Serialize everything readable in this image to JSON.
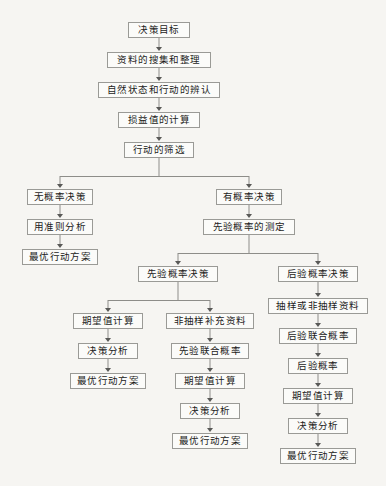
{
  "diagram": {
    "type": "flowchart",
    "orientation": "top-down",
    "style": {
      "background_color": "#f6f5f2",
      "node_fill": "#fbfbf9",
      "node_border": "#9a9a96",
      "connector_color": "#8d8d89",
      "text_color": "#1b1b1b"
    },
    "nodes": [
      {
        "id": "n1",
        "label": "决策目标",
        "cx": 159,
        "y": 22,
        "w": 62
      },
      {
        "id": "n2",
        "label": "资料的搜集和整理",
        "cx": 159,
        "y": 52,
        "w": 104
      },
      {
        "id": "n3",
        "label": "自然状态和行动的辨认",
        "cx": 159,
        "y": 82,
        "w": 122
      },
      {
        "id": "n4",
        "label": "损益值的计算",
        "cx": 159,
        "y": 112,
        "w": 82
      },
      {
        "id": "n5",
        "label": "行动的筛选",
        "cx": 159,
        "y": 142,
        "w": 70
      },
      {
        "id": "n6",
        "label": "无概率决策",
        "cx": 60,
        "y": 189,
        "w": 66
      },
      {
        "id": "n7",
        "label": "用准则分析",
        "cx": 60,
        "y": 219,
        "w": 66
      },
      {
        "id": "n8",
        "label": "最优行动方案",
        "cx": 60,
        "y": 249,
        "w": 76
      },
      {
        "id": "n9",
        "label": "有概率决策",
        "cx": 249,
        "y": 189,
        "w": 66
      },
      {
        "id": "n10",
        "label": "先验概率的测定",
        "cx": 249,
        "y": 219,
        "w": 92
      },
      {
        "id": "n11",
        "label": "先验概率决策",
        "cx": 178,
        "y": 266,
        "w": 80
      },
      {
        "id": "n12",
        "label": "后验概率决策",
        "cx": 318,
        "y": 266,
        "w": 80
      },
      {
        "id": "n13",
        "label": "期望值计算",
        "cx": 108,
        "y": 313,
        "w": 70
      },
      {
        "id": "n14",
        "label": "决策分析",
        "cx": 108,
        "y": 343,
        "w": 60
      },
      {
        "id": "n15",
        "label": "最优行动方案",
        "cx": 108,
        "y": 373,
        "w": 76
      },
      {
        "id": "n16",
        "label": "非抽样补充资料",
        "cx": 210,
        "y": 313,
        "w": 88
      },
      {
        "id": "n17",
        "label": "先验联合概率",
        "cx": 210,
        "y": 343,
        "w": 78
      },
      {
        "id": "n18",
        "label": "期望值计算",
        "cx": 210,
        "y": 373,
        "w": 70
      },
      {
        "id": "n19",
        "label": "决策分析",
        "cx": 210,
        "y": 403,
        "w": 60
      },
      {
        "id": "n20",
        "label": "最优行动方案",
        "cx": 210,
        "y": 433,
        "w": 76
      },
      {
        "id": "n21",
        "label": "抽样或非抽样资料",
        "cx": 318,
        "y": 298,
        "w": 100
      },
      {
        "id": "n22",
        "label": "后验联合概率",
        "cx": 318,
        "y": 328,
        "w": 78
      },
      {
        "id": "n23",
        "label": "后验概率",
        "cx": 318,
        "y": 358,
        "w": 60
      },
      {
        "id": "n24",
        "label": "期望值计算",
        "cx": 318,
        "y": 388,
        "w": 70
      },
      {
        "id": "n25",
        "label": "决策分析",
        "cx": 318,
        "y": 418,
        "w": 60
      },
      {
        "id": "n26",
        "label": "最优行动方案",
        "cx": 318,
        "y": 448,
        "w": 76
      }
    ],
    "edges": [
      {
        "from": "n1",
        "to": "n2",
        "kind": "straight"
      },
      {
        "from": "n2",
        "to": "n3",
        "kind": "straight"
      },
      {
        "from": "n3",
        "to": "n4",
        "kind": "straight"
      },
      {
        "from": "n4",
        "to": "n5",
        "kind": "straight"
      },
      {
        "from": "n5",
        "to": "n6",
        "kind": "split"
      },
      {
        "from": "n5",
        "to": "n9",
        "kind": "split"
      },
      {
        "from": "n6",
        "to": "n7",
        "kind": "straight"
      },
      {
        "from": "n7",
        "to": "n8",
        "kind": "straight"
      },
      {
        "from": "n9",
        "to": "n10",
        "kind": "straight"
      },
      {
        "from": "n10",
        "to": "n11",
        "kind": "split"
      },
      {
        "from": "n10",
        "to": "n12",
        "kind": "split"
      },
      {
        "from": "n11",
        "to": "n13",
        "kind": "split"
      },
      {
        "from": "n11",
        "to": "n16",
        "kind": "split"
      },
      {
        "from": "n13",
        "to": "n14",
        "kind": "straight"
      },
      {
        "from": "n14",
        "to": "n15",
        "kind": "straight"
      },
      {
        "from": "n16",
        "to": "n17",
        "kind": "straight"
      },
      {
        "from": "n17",
        "to": "n18",
        "kind": "straight"
      },
      {
        "from": "n18",
        "to": "n19",
        "kind": "straight"
      },
      {
        "from": "n19",
        "to": "n20",
        "kind": "straight"
      },
      {
        "from": "n12",
        "to": "n21",
        "kind": "straight"
      },
      {
        "from": "n21",
        "to": "n22",
        "kind": "straight"
      },
      {
        "from": "n22",
        "to": "n23",
        "kind": "straight"
      },
      {
        "from": "n23",
        "to": "n24",
        "kind": "straight"
      },
      {
        "from": "n24",
        "to": "n25",
        "kind": "straight"
      },
      {
        "from": "n25",
        "to": "n26",
        "kind": "straight"
      }
    ],
    "branch_bars": [
      {
        "id": "b1",
        "parent": "n5",
        "bar_y": 176,
        "left_x": 60,
        "right_x": 249,
        "stem_x": 159
      },
      {
        "id": "b2",
        "parent": "n10",
        "bar_y": 253,
        "left_x": 178,
        "right_x": 318,
        "stem_x": 249
      },
      {
        "id": "b3",
        "parent": "n11",
        "bar_y": 300,
        "left_x": 108,
        "right_x": 210,
        "stem_x": 178
      }
    ]
  }
}
